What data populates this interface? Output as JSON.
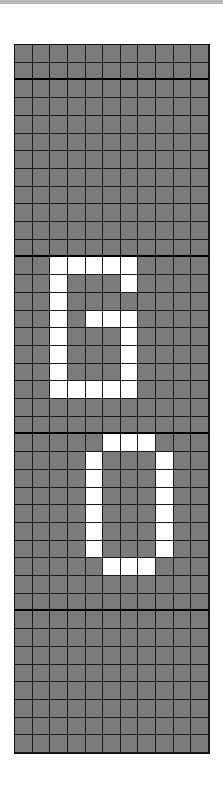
{
  "board": {
    "columns": 11,
    "rows": 40,
    "section_dividers_after_rows": [
      1,
      11,
      21,
      31
    ],
    "colors": {
      "off": "#7b7b7b",
      "on": "#ffffff",
      "grid_line": "#1a1a1a",
      "top_bar": "#b9b9b9"
    },
    "lit_cells": [
      [
        12,
        2
      ],
      [
        12,
        3
      ],
      [
        12,
        4
      ],
      [
        12,
        5
      ],
      [
        12,
        6
      ],
      [
        13,
        2
      ],
      [
        13,
        6
      ],
      [
        14,
        2
      ],
      [
        15,
        2
      ],
      [
        15,
        4
      ],
      [
        15,
        5
      ],
      [
        15,
        6
      ],
      [
        16,
        2
      ],
      [
        16,
        6
      ],
      [
        17,
        2
      ],
      [
        17,
        6
      ],
      [
        18,
        2
      ],
      [
        18,
        6
      ],
      [
        19,
        2
      ],
      [
        19,
        3
      ],
      [
        19,
        4
      ],
      [
        19,
        5
      ],
      [
        19,
        6
      ],
      [
        22,
        5
      ],
      [
        22,
        6
      ],
      [
        22,
        7
      ],
      [
        23,
        4
      ],
      [
        23,
        8
      ],
      [
        24,
        4
      ],
      [
        24,
        8
      ],
      [
        25,
        4
      ],
      [
        25,
        8
      ],
      [
        26,
        4
      ],
      [
        26,
        8
      ],
      [
        27,
        4
      ],
      [
        27,
        8
      ],
      [
        28,
        4
      ],
      [
        28,
        8
      ],
      [
        29,
        5
      ],
      [
        29,
        6
      ],
      [
        29,
        7
      ]
    ],
    "displayed_text": "60"
  }
}
